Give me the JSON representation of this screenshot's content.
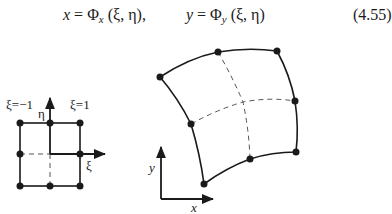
{
  "equation": {
    "lhs_x": "x",
    "equals": " = ",
    "phi": "Φ",
    "sub_x": "x",
    "args": "(ξ, η)",
    "comma": ",",
    "lhs_y": "y",
    "sub_y": "y",
    "number": "(4.55)"
  },
  "reference_element": {
    "labels": {
      "xi_minus": "ξ=−1",
      "xi_plus": "ξ=1",
      "eta_axis": "η",
      "xi_axis": "ξ"
    },
    "nodes": [
      [
        20,
        123
      ],
      [
        50,
        123
      ],
      [
        80,
        123
      ],
      [
        20,
        154
      ],
      [
        80,
        154
      ],
      [
        20,
        186
      ],
      [
        50,
        186
      ],
      [
        80,
        186
      ]
    ]
  },
  "physical_element": {
    "labels": {
      "x_axis": "x",
      "y_axis": "y"
    },
    "nodes": [
      [
        160,
        77
      ],
      [
        218,
        52
      ],
      [
        277,
        51
      ],
      [
        191,
        124
      ],
      [
        295,
        101
      ],
      [
        204,
        184
      ],
      [
        250,
        159
      ],
      [
        296,
        152
      ]
    ],
    "center": [
      243,
      102
    ]
  },
  "colors": {
    "ink": "#1a1a1a",
    "dash": "#555555"
  }
}
